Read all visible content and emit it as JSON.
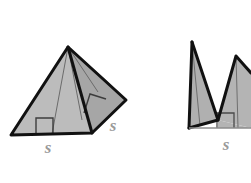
{
  "figure": {
    "background_color": "#ffffff",
    "stroke_color": "#1a1a1a",
    "thin_stroke_color": "#4d4d4d",
    "label_color": "#9a9a9a",
    "fill_light": "#b9b9b9",
    "fill_mid": "#ababab",
    "fill_dark": "#9e9e9e",
    "labels": {
      "left_base": "s",
      "left_slant": "s",
      "right_base": "s"
    },
    "annotations": {
      "right_angle_marker": "right-angle",
      "right_angle_count": 3
    }
  }
}
